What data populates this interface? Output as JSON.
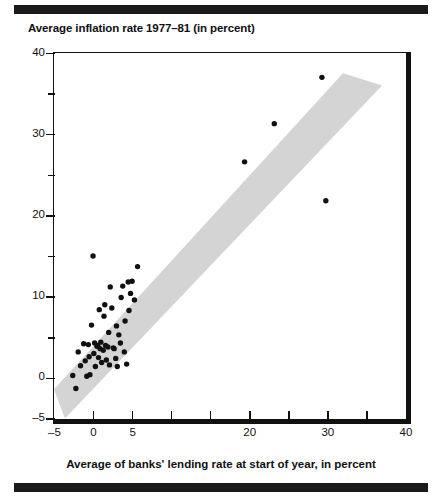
{
  "figure": {
    "title": "Average inflation rate 1977–81 (in percent)",
    "rule_top": "decorative-rule",
    "rule_bottom": "decorative-rule"
  },
  "chart_data": {
    "type": "scatter",
    "title": "Average inflation rate 1977–81 (in percent)",
    "xlabel": "Average of banks' lending rate at start of year, in percent",
    "ylabel": "Average inflation rate 1977–81 (in percent)",
    "xlim": [
      -5,
      40
    ],
    "ylim": [
      -5,
      40
    ],
    "grid": false,
    "legend": null,
    "marker": {
      "shape": "circle",
      "color": "#111111",
      "size": 5
    },
    "x_major_ticks": [
      -5,
      0,
      5,
      20,
      30,
      40
    ],
    "x_major_tick_labels": [
      "–5",
      "0",
      "5",
      "20",
      "30",
      "40"
    ],
    "x_minor_ticks": [
      0,
      5,
      10,
      15,
      20,
      25,
      30,
      35
    ],
    "y_major_ticks": [
      -5,
      0,
      10,
      20,
      30,
      40
    ],
    "y_major_tick_labels": [
      "–5",
      "0",
      "10",
      "20",
      "30",
      "40"
    ],
    "y_minor_ticks": [
      5,
      15,
      25,
      35
    ],
    "band": {
      "name": "shaded-confidence-band",
      "color": "#d4d4d4",
      "description": "Diagonal grey band running from lower-left to upper-right, roughly parallel to the 45-degree line, clipped by the plot frame.",
      "lower_edge": [
        [
          -3.6,
          -5.0
        ],
        [
          37.0,
          36.0
        ]
      ],
      "upper_edge": [
        [
          -5.0,
          -1.4
        ],
        [
          32.0,
          37.5
        ]
      ]
    },
    "points": [
      {
        "x": -2.6,
        "y": 0.3
      },
      {
        "x": -2.2,
        "y": -1.3
      },
      {
        "x": -1.9,
        "y": 3.2
      },
      {
        "x": -1.6,
        "y": 1.5
      },
      {
        "x": -1.2,
        "y": 4.2
      },
      {
        "x": -1.0,
        "y": 2.1
      },
      {
        "x": -0.8,
        "y": 0.2
      },
      {
        "x": -0.6,
        "y": 4.1
      },
      {
        "x": -0.5,
        "y": 2.6
      },
      {
        "x": -0.4,
        "y": 0.4
      },
      {
        "x": -0.2,
        "y": 6.5
      },
      {
        "x": 0.0,
        "y": 15.0
      },
      {
        "x": 0.1,
        "y": 3.0
      },
      {
        "x": 0.2,
        "y": 4.3
      },
      {
        "x": 0.3,
        "y": 1.4
      },
      {
        "x": 0.5,
        "y": 3.9
      },
      {
        "x": 0.6,
        "y": 4.0
      },
      {
        "x": 0.7,
        "y": 2.5
      },
      {
        "x": 0.8,
        "y": 8.4
      },
      {
        "x": 0.9,
        "y": 3.6
      },
      {
        "x": 1.0,
        "y": 4.4
      },
      {
        "x": 1.1,
        "y": 1.9
      },
      {
        "x": 1.3,
        "y": 3.4
      },
      {
        "x": 1.4,
        "y": 7.6
      },
      {
        "x": 1.5,
        "y": 9.0
      },
      {
        "x": 1.6,
        "y": 4.0
      },
      {
        "x": 1.7,
        "y": 2.2
      },
      {
        "x": 1.9,
        "y": 3.8
      },
      {
        "x": 2.0,
        "y": 5.6
      },
      {
        "x": 2.1,
        "y": 1.6
      },
      {
        "x": 2.2,
        "y": 11.2
      },
      {
        "x": 2.4,
        "y": 8.6
      },
      {
        "x": 2.6,
        "y": 3.7
      },
      {
        "x": 2.7,
        "y": 3.6
      },
      {
        "x": 2.9,
        "y": 2.4
      },
      {
        "x": 3.0,
        "y": 6.4
      },
      {
        "x": 3.1,
        "y": 1.4
      },
      {
        "x": 3.3,
        "y": 5.3
      },
      {
        "x": 3.5,
        "y": 4.3
      },
      {
        "x": 3.6,
        "y": 9.9
      },
      {
        "x": 3.8,
        "y": 11.3
      },
      {
        "x": 4.0,
        "y": 3.2
      },
      {
        "x": 4.1,
        "y": 7.0
      },
      {
        "x": 4.3,
        "y": 1.7
      },
      {
        "x": 4.5,
        "y": 11.8
      },
      {
        "x": 4.6,
        "y": 8.3
      },
      {
        "x": 4.8,
        "y": 10.4
      },
      {
        "x": 5.0,
        "y": 11.9
      },
      {
        "x": 5.3,
        "y": 9.6
      },
      {
        "x": 5.7,
        "y": 13.7
      },
      {
        "x": 19.4,
        "y": 26.6
      },
      {
        "x": 23.2,
        "y": 31.3
      },
      {
        "x": 29.3,
        "y": 37.0
      },
      {
        "x": 29.8,
        "y": 21.8
      }
    ]
  }
}
